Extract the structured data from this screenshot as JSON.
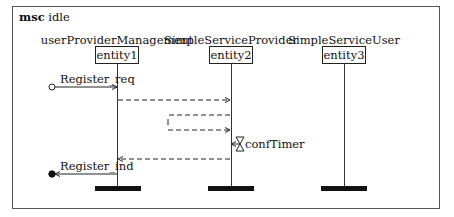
{
  "diagram": {
    "type": "message-sequence-chart",
    "title_keyword": "msc",
    "title_name": "idle",
    "entities": [
      {
        "name": "userProviderManagement",
        "instance": "entity1"
      },
      {
        "name": "SimpleServiceProvider",
        "instance": "entity2"
      },
      {
        "name": "SimpleServiceUser",
        "instance": "entity3"
      }
    ],
    "messages": [
      {
        "label": "Register_req",
        "from": "environment",
        "to": "entity1",
        "style": "solid"
      },
      {
        "label": "",
        "from": "entity1",
        "to": "entity2",
        "style": "dashed"
      },
      {
        "label": "",
        "from": "entity2",
        "to": "entity2",
        "style": "dashed-self-loop"
      },
      {
        "label": "",
        "from": "entity2",
        "to": "entity1",
        "style": "dashed"
      },
      {
        "label": "Register_ind",
        "from": "entity1",
        "to": "environment",
        "style": "solid"
      }
    ],
    "timer": {
      "label": "confTimer",
      "on": "entity2"
    }
  }
}
